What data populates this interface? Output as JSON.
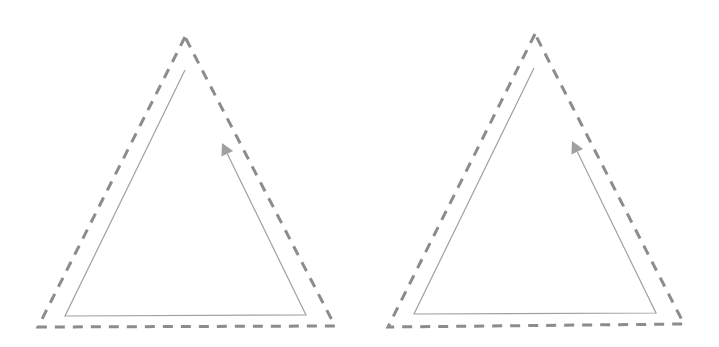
{
  "diagram": {
    "type": "paired-triangle-paths",
    "colors": {
      "background": "#ffffff",
      "dashed_stroke": "#8c8c8c",
      "solid_stroke": "#a0a0a0",
      "arrowhead": "#a0a0a0"
    },
    "panels": [
      {
        "id": "left",
        "outer_dashed_triangle": {
          "apex": [
            185,
            37
          ],
          "bottom_left": [
            38,
            327
          ],
          "bottom_right": [
            335,
            326
          ]
        },
        "inner_path": {
          "points": [
            [
              222,
              143
            ],
            [
              306,
              315
            ],
            [
              65,
              316
            ],
            [
              185,
              70
            ]
          ],
          "arrow_at_end_of": "right edge, pointing up toward apex",
          "arrow_tip": [
            222,
            143
          ]
        }
      },
      {
        "id": "right",
        "outer_dashed_triangle": {
          "apex": [
            535,
            34
          ],
          "bottom_left": [
            388,
            327
          ],
          "bottom_right": [
            684,
            324
          ]
        },
        "inner_path": {
          "points": [
            [
              572,
              141
            ],
            [
              656,
              313
            ],
            [
              414,
              314
            ],
            [
              534,
              68
            ]
          ],
          "arrow_at_end_of": "right edge, pointing up toward apex",
          "arrow_tip": [
            572,
            141
          ]
        }
      }
    ]
  }
}
